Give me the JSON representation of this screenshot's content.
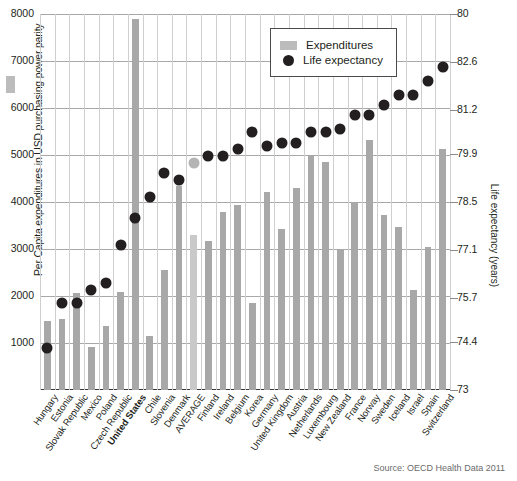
{
  "chart_data": {
    "type": "bar",
    "title": "",
    "subtitle": "",
    "xlabel": "",
    "ylabel": "Per Capita expenditures in USD purchasing power parity",
    "y2label": "Life expectancy (years)",
    "ylim": [
      0,
      8000
    ],
    "y2lim": [
      73,
      84
    ],
    "grid": true,
    "legend_position": "top-right",
    "source": "Source: OECD Health Data 2011",
    "left_ticks": [
      "8000",
      "7000",
      "6000",
      "5000",
      "4000",
      "3000",
      "2000",
      "1000"
    ],
    "left_tick_values": [
      8000,
      7000,
      6000,
      5000,
      4000,
      3000,
      2000,
      1000
    ],
    "right_ticks": [
      "80",
      "82.6",
      "81.2",
      "79.9",
      "78.5",
      "77.1",
      "75.7",
      "74.4",
      "73"
    ],
    "right_tick_values": [
      84,
      82.6,
      81.2,
      79.9,
      78.5,
      77.1,
      75.7,
      74.4,
      73
    ],
    "categories": [
      "Hungary",
      "Estonia",
      "Slovak Republic",
      "Mexico",
      "Poland",
      "Czech Republic",
      "United States",
      "Chile",
      "Slovenia",
      "Denmark",
      "AVERAGE",
      "Finland",
      "Ireland",
      "Belgium",
      "Korea",
      "Germany",
      "United Kingdom",
      "Austria",
      "Netherlands",
      "Luxembourg",
      "New Zealand",
      "France",
      "Norway",
      "Sweden",
      "Iceland",
      "Israel",
      "Spain",
      "Switzerland"
    ],
    "highlighted_category": "United States",
    "average_category": "AVERAGE",
    "series": [
      {
        "name": "Expenditures",
        "type": "bar",
        "color": "#a8a8a8",
        "values": [
          1470,
          1510,
          2070,
          920,
          1360,
          2080,
          7900,
          1150,
          2550,
          4350,
          3290,
          3180,
          3780,
          3940,
          1860,
          4220,
          3430,
          4290,
          5010,
          4850,
          2980,
          3970,
          5330,
          3730,
          3460,
          2120,
          3050,
          5120
        ]
      },
      {
        "name": "Life expectancy",
        "type": "scatter",
        "color": "#231f20",
        "average_color": "#b4b4b4",
        "values": [
          74.4,
          75.7,
          75.7,
          76.1,
          76.3,
          77.4,
          78.2,
          78.8,
          79.5,
          79.3,
          79.8,
          80.0,
          80.0,
          80.2,
          80.7,
          80.3,
          80.4,
          80.4,
          80.7,
          80.7,
          80.8,
          81.2,
          81.2,
          81.5,
          81.8,
          81.8,
          82.2,
          82.6
        ]
      }
    ]
  },
  "legend": {
    "items": [
      {
        "label": "Expenditures",
        "marker": "bar-swatch"
      },
      {
        "label": "Life expectancy",
        "marker": "dot-marker"
      }
    ]
  }
}
